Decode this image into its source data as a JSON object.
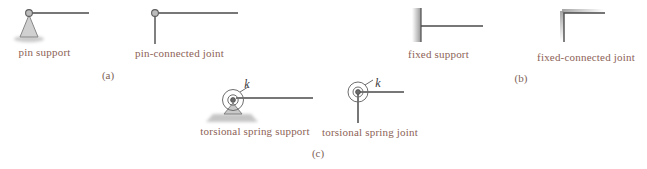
{
  "figure": {
    "groups": [
      {
        "caption": "(a)",
        "items": [
          {
            "label": "pin support"
          },
          {
            "label": "pin-connected joint"
          }
        ]
      },
      {
        "caption": "(b)",
        "items": [
          {
            "label": "fixed support"
          },
          {
            "label": "fixed-connected joint"
          }
        ]
      },
      {
        "caption": "(c)",
        "items": [
          {
            "label": "torsional spring support"
          },
          {
            "label": "torsional spring joint"
          }
        ]
      }
    ],
    "spring_constant_symbol": "k",
    "colors": {
      "label_text": "#8c6256",
      "caption_text": "#7d6158",
      "line": "#4a4a4a",
      "member_fill": "#cccccc",
      "shading": "#9a9a9a"
    }
  }
}
